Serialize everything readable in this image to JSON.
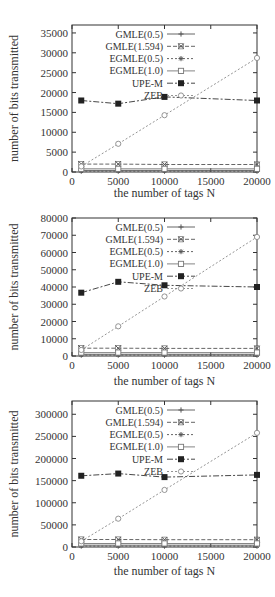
{
  "chart_data": [
    {
      "type": "line",
      "title": "",
      "xlabel": "the number of tags N",
      "ylabel": "number of bits transmitted",
      "xlim": [
        0,
        20000
      ],
      "ylim": [
        0,
        37000
      ],
      "xticks": [
        0,
        5000,
        10000,
        15000,
        20000
      ],
      "yticks": [
        0,
        5000,
        10000,
        15000,
        20000,
        25000,
        30000,
        35000
      ],
      "grid": false,
      "legend_position": "upper-left-inside",
      "x": [
        1000,
        5000,
        10000,
        20000
      ],
      "series": [
        {
          "name": "GMLE(0.5)",
          "values": [
            400,
            400,
            400,
            400
          ]
        },
        {
          "name": "GMLE(1.594)",
          "values": [
            2000,
            2000,
            1900,
            1900
          ]
        },
        {
          "name": "EGMLE(0.5)",
          "values": [
            200,
            200,
            200,
            200
          ]
        },
        {
          "name": "EGMLE(1.0)",
          "values": [
            800,
            800,
            800,
            800
          ]
        },
        {
          "name": "UPE-M",
          "values": [
            18000,
            17200,
            18900,
            18000
          ]
        },
        {
          "name": "ZEB",
          "values": [
            1400,
            7100,
            14300,
            28700
          ]
        }
      ]
    },
    {
      "type": "line",
      "title": "",
      "xlabel": "the number of tags N",
      "ylabel": "number of bits transmitted",
      "xlim": [
        0,
        20000
      ],
      "ylim": [
        0,
        80000
      ],
      "xticks": [
        0,
        5000,
        10000,
        15000,
        20000
      ],
      "yticks": [
        0,
        10000,
        20000,
        30000,
        40000,
        50000,
        60000,
        70000,
        80000
      ],
      "grid": false,
      "legend_position": "upper-left-inside",
      "x": [
        1000,
        5000,
        10000,
        20000
      ],
      "series": [
        {
          "name": "GMLE(0.5)",
          "values": [
            1000,
            1000,
            1000,
            1000
          ]
        },
        {
          "name": "GMLE(1.594)",
          "values": [
            4500,
            4500,
            4400,
            4400
          ]
        },
        {
          "name": "EGMLE(0.5)",
          "values": [
            500,
            500,
            500,
            500
          ]
        },
        {
          "name": "EGMLE(1.0)",
          "values": [
            2000,
            2000,
            2000,
            2000
          ]
        },
        {
          "name": "UPE-M",
          "values": [
            36700,
            43000,
            41000,
            40000
          ]
        },
        {
          "name": "ZEB",
          "values": [
            3500,
            17200,
            34500,
            69000
          ]
        }
      ]
    },
    {
      "type": "line",
      "title": "",
      "xlabel": "the number of tags N",
      "ylabel": "number of bits transmitted",
      "xlim": [
        0,
        20000
      ],
      "ylim": [
        0,
        330000
      ],
      "xticks": [
        0,
        5000,
        10000,
        15000,
        20000
      ],
      "yticks": [
        0,
        50000,
        100000,
        150000,
        200000,
        250000,
        300000
      ],
      "grid": false,
      "legend_position": "upper-left-inside",
      "x": [
        1000,
        5000,
        10000,
        20000
      ],
      "series": [
        {
          "name": "GMLE(0.5)",
          "values": [
            4000,
            4000,
            4000,
            4000
          ]
        },
        {
          "name": "GMLE(1.594)",
          "values": [
            17000,
            17000,
            16500,
            16500
          ]
        },
        {
          "name": "EGMLE(0.5)",
          "values": [
            2000,
            2000,
            2000,
            2000
          ]
        },
        {
          "name": "EGMLE(1.0)",
          "values": [
            8000,
            8000,
            8000,
            8000
          ]
        },
        {
          "name": "UPE-M",
          "values": [
            161000,
            166000,
            158000,
            163000
          ]
        },
        {
          "name": "ZEB",
          "values": [
            13000,
            64000,
            129000,
            258000
          ]
        }
      ]
    }
  ],
  "charts": [
    {
      "xlabel": "the number of tags N",
      "ylabel": "number of bits transmitted"
    },
    {
      "xlabel": "the number of tags N",
      "ylabel": "number of bits transmitted"
    },
    {
      "xlabel": "the number of tags N",
      "ylabel": "number of bits transmitted"
    }
  ],
  "legend": [
    "GMLE(0.5)",
    "GMLE(1.594)",
    "EGMLE(0.5)",
    "EGMLE(1.0)",
    "UPE-M",
    "ZEB"
  ]
}
